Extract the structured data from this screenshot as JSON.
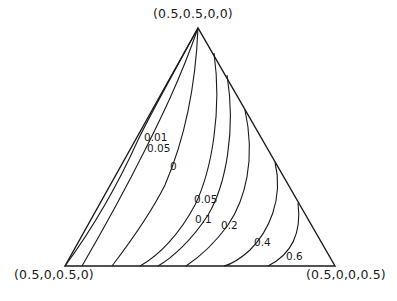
{
  "diagram": {
    "type": "ternary-contour-plot",
    "vertices": {
      "top": "(0.5,0.5,0,0)",
      "bottom_left": "(0.5,0,0.5,0)",
      "bottom_right": "(0.5,0,0,0.5)"
    },
    "contour_labels": [
      {
        "id": "c001",
        "value": "0.01"
      },
      {
        "id": "c005a",
        "value": "0.05"
      },
      {
        "id": "c0",
        "value": "0"
      },
      {
        "id": "c005b",
        "value": "0.05"
      },
      {
        "id": "c01",
        "value": "0.1"
      },
      {
        "id": "c02",
        "value": "0.2"
      },
      {
        "id": "c04",
        "value": "0.4"
      },
      {
        "id": "c06",
        "value": "0.6"
      }
    ],
    "line_color": "#1a1a1a",
    "background": "#ffffff"
  }
}
